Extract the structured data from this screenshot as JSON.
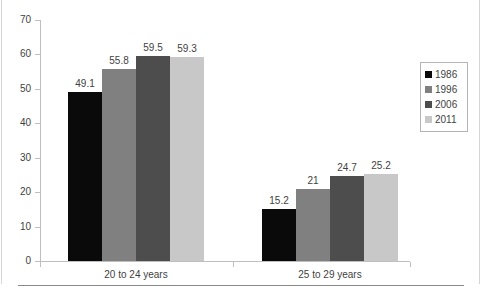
{
  "chart_data": {
    "type": "bar",
    "title": "",
    "subtitle": "",
    "xlabel": "",
    "ylabel": "",
    "categories": [
      "20 to 24 years",
      "25 to 29 years"
    ],
    "series": [
      {
        "name": "1986",
        "color": "#0a0a0a",
        "values": [
          49.1,
          15.2
        ]
      },
      {
        "name": "1996",
        "color": "#808080",
        "values": [
          55.8,
          21
        ]
      },
      {
        "name": "2006",
        "color": "#4d4d4d",
        "values": [
          59.5,
          24.7
        ]
      },
      {
        "name": "2011",
        "color": "#c8c8c8",
        "values": [
          59.3,
          25.2
        ]
      }
    ],
    "value_labels": [
      [
        "49.1",
        "55.8",
        "59.5",
        "59.3"
      ],
      [
        "15.2",
        "21",
        "24.7",
        "25.2"
      ]
    ],
    "ylim": [
      0,
      70
    ],
    "ytick_values": [
      0,
      10,
      20,
      30,
      40,
      50,
      60,
      70
    ],
    "ytick_labels": [
      "0",
      "10",
      "20",
      "30",
      "40",
      "50",
      "60",
      "70"
    ],
    "grid": false,
    "legend_position": "right",
    "legend_entries": [
      "1986",
      "1996",
      "2006",
      "2011"
    ],
    "bar_gap_within_group": 0,
    "axis_color": "#bfbfbf"
  }
}
